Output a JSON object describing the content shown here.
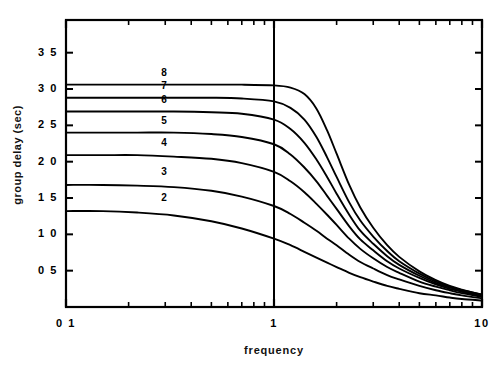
{
  "chart_data": {
    "type": "line",
    "title": "",
    "xlabel": "frequency",
    "ylabel": "group delay  (sec)",
    "xscale": "log",
    "yscale": "linear",
    "xlim": [
      0.1,
      10
    ],
    "ylim": [
      0.0,
      3.95
    ],
    "grid": false,
    "legend": "inline-curve-labels",
    "xticks": [
      {
        "value": 0.1,
        "label": "0 1"
      },
      {
        "value": 1,
        "label": "1"
      },
      {
        "value": 10,
        "label": "10"
      }
    ],
    "yticks": [
      {
        "value": 3.5,
        "label": "3 5"
      },
      {
        "value": 3.0,
        "label": "3 0"
      },
      {
        "value": 2.5,
        "label": "2 5"
      },
      {
        "value": 2.0,
        "label": "2 0"
      },
      {
        "value": 1.5,
        "label": "1 5"
      },
      {
        "value": 1.0,
        "label": "1 0"
      },
      {
        "value": 0.5,
        "label": "0 5"
      }
    ],
    "annotations": [
      {
        "name": "reference-line",
        "type": "vline",
        "x": 1
      }
    ],
    "series": [
      {
        "name": "8",
        "label": "8",
        "order": 8,
        "plateau": 3.06,
        "label_x": 1.0,
        "label_y": 3.22,
        "x": [
          0.1,
          0.15,
          0.22,
          0.33,
          0.5,
          0.7,
          1.0,
          1.2,
          1.4,
          1.6,
          1.8,
          2.0,
          2.3,
          2.6,
          3.0,
          3.5,
          4.0,
          5.0,
          6.0,
          7.0,
          8.0,
          10.0
        ],
        "y": [
          3.06,
          3.06,
          3.06,
          3.06,
          3.06,
          3.06,
          3.05,
          3.02,
          2.93,
          2.73,
          2.43,
          2.11,
          1.68,
          1.37,
          1.09,
          0.85,
          0.69,
          0.49,
          0.37,
          0.29,
          0.24,
          0.17
        ]
      },
      {
        "name": "7",
        "label": "7",
        "order": 7,
        "plateau": 2.88,
        "label_x": 1.0,
        "label_y": 3.04,
        "x": [
          0.1,
          0.15,
          0.22,
          0.33,
          0.5,
          0.7,
          1.0,
          1.2,
          1.4,
          1.6,
          1.8,
          2.0,
          2.3,
          2.6,
          3.0,
          3.5,
          4.0,
          5.0,
          6.0,
          7.0,
          8.0,
          10.0
        ],
        "y": [
          2.88,
          2.88,
          2.88,
          2.88,
          2.88,
          2.87,
          2.83,
          2.74,
          2.58,
          2.34,
          2.06,
          1.79,
          1.44,
          1.19,
          0.97,
          0.77,
          0.63,
          0.46,
          0.35,
          0.28,
          0.23,
          0.17
        ]
      },
      {
        "name": "6",
        "label": "6",
        "order": 6,
        "plateau": 2.69,
        "label_x": 1.0,
        "label_y": 2.85,
        "x": [
          0.1,
          0.15,
          0.22,
          0.33,
          0.5,
          0.7,
          1.0,
          1.2,
          1.4,
          1.6,
          1.8,
          2.0,
          2.3,
          2.6,
          3.0,
          3.5,
          4.0,
          5.0,
          6.0,
          7.0,
          8.0,
          10.0
        ],
        "y": [
          2.69,
          2.69,
          2.69,
          2.69,
          2.68,
          2.66,
          2.58,
          2.45,
          2.26,
          2.03,
          1.79,
          1.56,
          1.27,
          1.05,
          0.87,
          0.7,
          0.58,
          0.43,
          0.33,
          0.27,
          0.22,
          0.16
        ]
      },
      {
        "name": "5",
        "label": "5",
        "order": 5,
        "plateau": 2.4,
        "label_x": 1.0,
        "label_y": 2.56,
        "x": [
          0.1,
          0.15,
          0.22,
          0.33,
          0.5,
          0.7,
          1.0,
          1.2,
          1.4,
          1.6,
          1.8,
          2.0,
          2.3,
          2.6,
          3.0,
          3.5,
          4.0,
          5.0,
          6.0,
          7.0,
          8.0,
          10.0
        ],
        "y": [
          2.4,
          2.4,
          2.4,
          2.4,
          2.38,
          2.34,
          2.24,
          2.1,
          1.92,
          1.73,
          1.53,
          1.35,
          1.11,
          0.93,
          0.78,
          0.63,
          0.53,
          0.4,
          0.31,
          0.25,
          0.21,
          0.15
        ]
      },
      {
        "name": "4",
        "label": "4",
        "order": 4,
        "plateau": 2.09,
        "label_x": 1.0,
        "label_y": 2.26,
        "x": [
          0.1,
          0.15,
          0.22,
          0.33,
          0.5,
          0.7,
          1.0,
          1.2,
          1.4,
          1.6,
          1.8,
          2.0,
          2.3,
          2.6,
          3.0,
          3.5,
          4.0,
          5.0,
          6.0,
          7.0,
          8.0,
          10.0
        ],
        "y": [
          2.09,
          2.09,
          2.09,
          2.07,
          2.04,
          1.98,
          1.86,
          1.73,
          1.58,
          1.42,
          1.27,
          1.13,
          0.94,
          0.8,
          0.67,
          0.55,
          0.47,
          0.35,
          0.28,
          0.23,
          0.19,
          0.14
        ]
      },
      {
        "name": "3",
        "label": "3",
        "order": 3,
        "plateau": 1.68,
        "label_x": 1.0,
        "label_y": 1.86,
        "x": [
          0.1,
          0.15,
          0.22,
          0.33,
          0.5,
          0.7,
          1.0,
          1.2,
          1.4,
          1.6,
          1.8,
          2.0,
          2.3,
          2.6,
          3.0,
          3.5,
          4.0,
          5.0,
          6.0,
          7.0,
          8.0,
          10.0
        ],
        "y": [
          1.68,
          1.68,
          1.67,
          1.65,
          1.6,
          1.52,
          1.39,
          1.28,
          1.16,
          1.05,
          0.94,
          0.85,
          0.72,
          0.62,
          0.53,
          0.44,
          0.38,
          0.29,
          0.23,
          0.19,
          0.16,
          0.12
        ]
      },
      {
        "name": "2",
        "label": "2",
        "order": 2,
        "plateau": 1.32,
        "label_x": 1.0,
        "label_y": 1.5,
        "x": [
          0.1,
          0.15,
          0.22,
          0.33,
          0.5,
          0.7,
          1.0,
          1.2,
          1.4,
          1.6,
          1.8,
          2.0,
          2.3,
          2.6,
          3.0,
          3.5,
          4.0,
          5.0,
          6.0,
          7.0,
          8.0,
          10.0
        ],
        "y": [
          1.32,
          1.32,
          1.3,
          1.26,
          1.18,
          1.08,
          0.94,
          0.85,
          0.76,
          0.68,
          0.61,
          0.55,
          0.47,
          0.41,
          0.35,
          0.29,
          0.25,
          0.19,
          0.16,
          0.13,
          0.11,
          0.09
        ]
      }
    ],
    "colors": {
      "line": "#000000",
      "axis": "#000000",
      "background": "#ffffff"
    }
  }
}
